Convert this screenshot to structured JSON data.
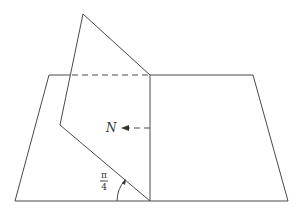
{
  "diagram": {
    "type": "geometry",
    "labels": {
      "normal": "N",
      "angle_numerator": "π",
      "angle_denominator": "4"
    },
    "colors": {
      "stroke": "#4a4a4a",
      "background": "#ffffff"
    },
    "shapes": {
      "horizontal_plane": [
        [
          49,
          75
        ],
        [
          253,
          75
        ],
        [
          288,
          201
        ],
        [
          15,
          201
        ]
      ],
      "tilted_plane": [
        [
          83,
          14
        ],
        [
          150,
          75
        ],
        [
          150,
          201
        ],
        [
          60,
          125
        ]
      ],
      "hidden_edge": [
        [
          70,
          75
        ],
        [
          150,
          75
        ]
      ],
      "normal_arrow": [
        [
          150,
          128
        ],
        [
          121,
          128
        ]
      ]
    }
  }
}
